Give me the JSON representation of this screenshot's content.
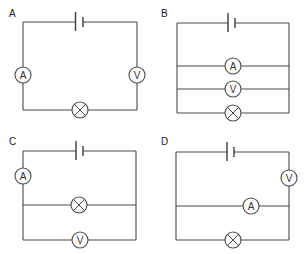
{
  "header": {
    "cutoff_text": ""
  },
  "colors": {
    "wire": "#4a4a4a",
    "background": "#ffffff"
  },
  "symbols": {
    "ammeter": "A",
    "voltmeter": "V",
    "lamp": "lamp-cross-icon",
    "cell": "cell-icon"
  },
  "circuits": [
    {
      "label": "A",
      "description": "Series loop: cell on top, ammeter on left side, voltmeter on right side, lamp on bottom",
      "components": [
        "cell",
        "ammeter",
        "lamp",
        "voltmeter"
      ]
    },
    {
      "label": "B",
      "description": "Cell on top; three parallel branches: ammeter, voltmeter, lamp",
      "components": [
        "cell",
        "ammeter",
        "voltmeter",
        "lamp"
      ]
    },
    {
      "label": "C",
      "description": "Cell on top; ammeter in series on left; lamp and voltmeter in parallel branches",
      "components": [
        "cell",
        "ammeter",
        "lamp",
        "voltmeter"
      ]
    },
    {
      "label": "D",
      "description": "Cell on top; voltmeter in series on right; ammeter and lamp in parallel branches",
      "components": [
        "cell",
        "voltmeter",
        "ammeter",
        "lamp"
      ]
    }
  ]
}
